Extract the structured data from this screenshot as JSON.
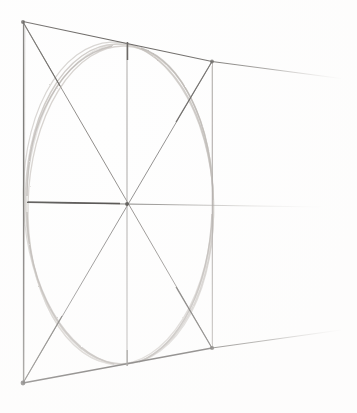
{
  "figure": {
    "medium": "pencil sketch on white paper",
    "background_color": "#ffffff",
    "ink_color_dark": "#56534f",
    "ink_color_mid": "#8e8a86",
    "ink_color_light": "#b9b5b1",
    "ellipse_color": "#c2bdb8"
  },
  "geometry": {
    "square_in_perspective": {
      "top_left": [
        23,
        22
      ],
      "top_right": [
        212,
        62
      ],
      "bottom_right": [
        212,
        348
      ],
      "bottom_left": [
        23,
        383
      ]
    },
    "vanishing_lines": {
      "top_edge_extended_to": [
        341,
        78
      ],
      "bottom_edge_extended_to": [
        341,
        330
      ],
      "horizon_line_extended_to": [
        322,
        207
      ]
    },
    "center_point": [
      127,
      204
    ],
    "mid_vertical": {
      "top": [
        127,
        42
      ],
      "bottom": [
        127,
        366
      ]
    },
    "mid_horizontal": {
      "left": [
        27,
        202
      ],
      "right": [
        322,
        207
      ]
    },
    "diagonals": [
      {
        "from": [
          23,
          22
        ],
        "to": [
          212,
          348
        ]
      },
      {
        "from": [
          23,
          383
        ],
        "to": [
          212,
          62
        ]
      }
    ],
    "ellipse": {
      "center": [
        119,
        204
      ],
      "radius_x": 95,
      "radius_y": 161,
      "rotation_deg": -1,
      "tangent_points": [
        [
          27,
          202
        ],
        [
          127,
          45
        ],
        [
          212,
          205
        ],
        [
          127,
          366
        ]
      ]
    }
  },
  "annotations": {
    "shape_count": 1,
    "line_count": 9,
    "labels": []
  }
}
